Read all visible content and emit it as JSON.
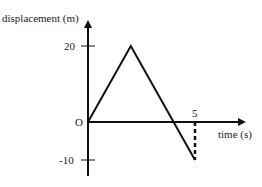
{
  "chart_data": {
    "type": "line",
    "title": "",
    "xlabel": "time (s)",
    "ylabel": "displacement (m)",
    "x": [
      0,
      2,
      5
    ],
    "series": [
      {
        "name": "displacement",
        "values": [
          0,
          20,
          -10
        ]
      }
    ],
    "x_ticks": [
      {
        "value": 5,
        "label": "5"
      }
    ],
    "y_ticks": [
      {
        "value": 20,
        "label": "20"
      },
      {
        "value": 0,
        "label": "O"
      },
      {
        "value": -10,
        "label": "-10"
      }
    ],
    "annotations": [
      {
        "type": "dashed-vertical",
        "x": 5,
        "from": -10,
        "to": 0
      }
    ],
    "xlim": [
      0,
      8
    ],
    "ylim": [
      -14,
      27
    ],
    "grid": false,
    "legend": "none",
    "colors": {
      "line": "#111111",
      "axis": "#111111",
      "text": "#222222"
    }
  }
}
